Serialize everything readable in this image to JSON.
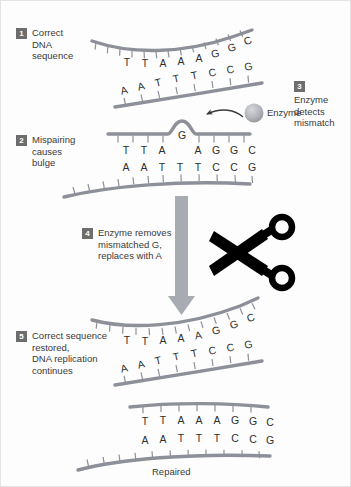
{
  "figure": {
    "background_color": "#fdfdfd",
    "strand_color": "#8d9098",
    "arrow_color": "#a9abb2",
    "badge_color": "#6d6d6d",
    "text_color": "#3a3a3a",
    "scissors_color": "#000000",
    "enzyme_color": "#b3b5bb"
  },
  "steps": [
    {
      "number": "1",
      "caption": "Correct\nDNA\nsequence"
    },
    {
      "number": "2",
      "caption": "Mispairing\ncauses\nbulge"
    },
    {
      "number": "3",
      "caption": "Enzyme\ndetects\nmismatch"
    },
    {
      "number": "4",
      "caption": "Enzyme removes\nmismatched G,\nreplaces with A"
    },
    {
      "number": "5",
      "caption": "Correct sequence\nrestored,\nDNA replication\ncontinues"
    }
  ],
  "labels": {
    "enzyme": "Enzyme",
    "repaired": "Repaired"
  },
  "panels": {
    "step1": {
      "top_strand_bases": [
        "T",
        "T",
        "A",
        "A",
        "A",
        "G",
        "G",
        "C"
      ],
      "bottom_strand_bases": [
        "A",
        "A",
        "T",
        "T",
        "T",
        "C",
        "C",
        "G"
      ]
    },
    "step2": {
      "top_strand_bases": [
        "T",
        "T",
        "A",
        "G",
        "A",
        "G",
        "G",
        "C"
      ],
      "bulge_base": "G",
      "bottom_strand_bases": [
        "A",
        "A",
        "T",
        "T",
        "T",
        "C",
        "C",
        "G"
      ]
    },
    "step5": {
      "top_strand_bases": [
        "T",
        "T",
        "A",
        "A",
        "A",
        "G",
        "G",
        "C"
      ],
      "bottom_strand_bases": [
        "A",
        "A",
        "T",
        "T",
        "T",
        "C",
        "C",
        "G"
      ]
    },
    "repaired": {
      "top_strand_bases": [
        "T",
        "T",
        "A",
        "A",
        "A",
        "G",
        "G",
        "C"
      ],
      "bottom_strand_bases": [
        "A",
        "A",
        "T",
        "T",
        "T",
        "C",
        "C",
        "G"
      ]
    }
  }
}
